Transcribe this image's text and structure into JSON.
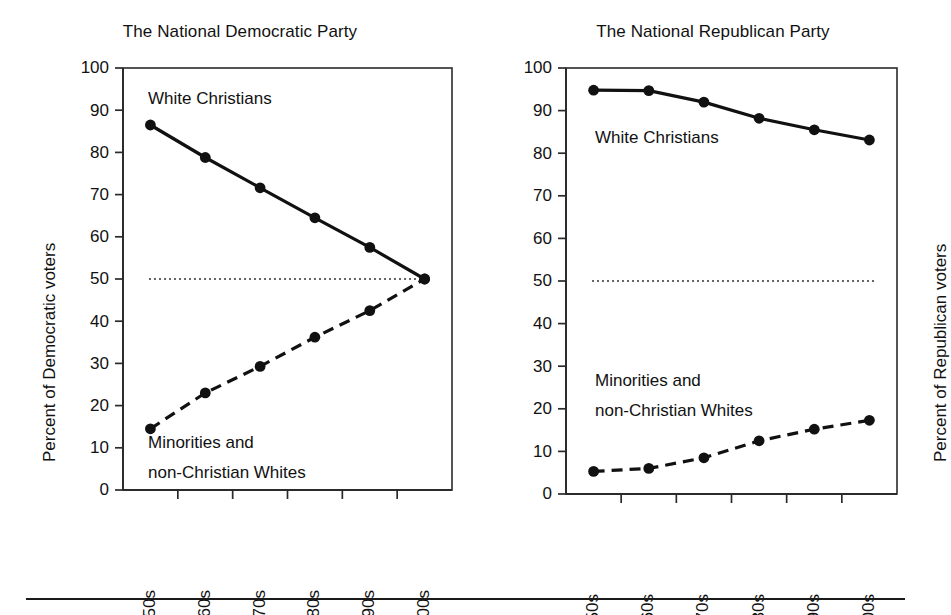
{
  "figure": {
    "background_color": "#ffffff",
    "ink_color": "#111111",
    "bottom_rule": true
  },
  "chart_data": [
    {
      "type": "line",
      "title": "The National Democratic Party",
      "xlabel": "",
      "ylabel": "Percent of Democratic voters",
      "categories": [
        "1950s",
        "1960s",
        "1970s",
        "1980s",
        "1990s",
        "2000s"
      ],
      "ylim": [
        0,
        100
      ],
      "yticks": [
        0,
        10,
        20,
        30,
        40,
        50,
        60,
        70,
        80,
        90,
        100
      ],
      "ytick_labels": [
        "0",
        "10",
        "20",
        "30",
        "40",
        "50",
        "60",
        "70",
        "80",
        "90",
        "100"
      ],
      "grid": false,
      "legend": "inline-annotations",
      "reference_line": {
        "value": 50,
        "style": "dotted"
      },
      "series": [
        {
          "name": "White Christians",
          "style": "solid",
          "marker": "filled-circle",
          "label_text": "White Christians",
          "values": [
            86.5,
            78.8,
            71.6,
            64.5,
            57.5,
            50.0
          ]
        },
        {
          "name": "Minorities and non-Christian Whites",
          "style": "dashed",
          "marker": "filled-circle",
          "label_text_line1": "Minorities and",
          "label_text_line2": "non-Christian Whites",
          "values": [
            14.5,
            23.0,
            29.3,
            36.2,
            42.5,
            50.0
          ]
        }
      ]
    },
    {
      "type": "line",
      "title": "The National Republican Party",
      "xlabel": "",
      "ylabel": "Percent of Republican voters",
      "categories": [
        "1950s",
        "1960s",
        "1970s",
        "1980s",
        "1990s",
        "2000s"
      ],
      "ylim": [
        0,
        100
      ],
      "yticks": [
        0,
        10,
        20,
        30,
        40,
        50,
        60,
        70,
        80,
        90,
        100
      ],
      "ytick_labels": [
        "0",
        "10",
        "20",
        "30",
        "40",
        "50",
        "60",
        "70",
        "80",
        "90",
        "100"
      ],
      "grid": false,
      "legend": "inline-annotations",
      "reference_line": {
        "value": 50,
        "style": "dotted"
      },
      "series": [
        {
          "name": "White Christians",
          "style": "solid",
          "marker": "filled-circle",
          "label_text": "White Christians",
          "values": [
            94.8,
            94.7,
            92.0,
            88.2,
            85.5,
            83.1
          ]
        },
        {
          "name": "Minorities and non-Christian Whites",
          "style": "dashed",
          "marker": "filled-circle",
          "label_text_line1": "Minorities and",
          "label_text_line2": "non-Christian Whites",
          "values": [
            5.3,
            6.0,
            8.5,
            12.5,
            15.2,
            17.3
          ]
        }
      ]
    }
  ]
}
